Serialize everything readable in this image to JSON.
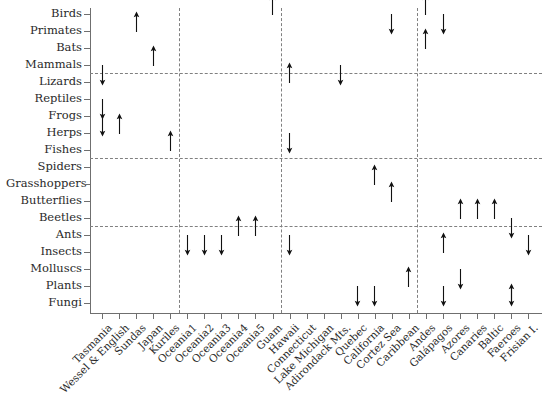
{
  "chart_data": {
    "type": "scatter",
    "title": "",
    "xlabel": "",
    "ylabel": "",
    "grid": false,
    "legend": null,
    "marker_semantics": {
      "up": "increase / positive effect",
      "down": "decrease / negative effect"
    },
    "categories_y": [
      "Birds",
      "Primates",
      "Bats",
      "Mammals",
      "Lizards",
      "Reptiles",
      "Frogs",
      "Herps",
      "Fishes",
      "Spiders",
      "Grasshoppers",
      "Butterflies",
      "Beetles",
      "Ants",
      "Insects",
      "Molluscs",
      "Plants",
      "Fungi"
    ],
    "categories_x": [
      "Tasmania",
      "Wessel & English",
      "Sundas",
      "Japan",
      "Kuriles",
      "Oceania1",
      "Oceania2",
      "Oceania3",
      "Oceania4",
      "Oceania5",
      "Guam",
      "Hawaii",
      "Connecticut",
      "Lake Michigan",
      "Adirondack Mts.",
      "Quebec",
      "California",
      "Cortez Sea",
      "Caribbean",
      "Andes",
      "Galápagos",
      "Azores",
      "Canaries",
      "Baltic",
      "Faeroes",
      "Frisian I."
    ],
    "group_separators_x": [
      "Kuriles",
      "Guam",
      "Caribbean"
    ],
    "reference_rows_y": [
      "Mammals",
      "Fishes",
      "Beetles"
    ],
    "points": [
      {
        "x": "Tasmania",
        "y": "Mammals",
        "dir": "down"
      },
      {
        "x": "Tasmania",
        "y": "Reptiles",
        "dir": "down"
      },
      {
        "x": "Tasmania",
        "y": "Frogs",
        "dir": "down"
      },
      {
        "x": "Wessel & English",
        "y": "Herps",
        "dir": "up"
      },
      {
        "x": "Sundas",
        "y": "Primates",
        "dir": "up"
      },
      {
        "x": "Japan",
        "y": "Mammals",
        "dir": "up"
      },
      {
        "x": "Kuriles",
        "y": "Fishes",
        "dir": "up"
      },
      {
        "x": "Oceania1",
        "y": "Ants",
        "dir": "down"
      },
      {
        "x": "Oceania2",
        "y": "Ants",
        "dir": "down"
      },
      {
        "x": "Oceania3",
        "y": "Ants",
        "dir": "down"
      },
      {
        "x": "Oceania4",
        "y": "Ants",
        "dir": "up"
      },
      {
        "x": "Oceania5",
        "y": "Ants",
        "dir": "up"
      },
      {
        "x": "Guam",
        "y": "Birds",
        "dir": "up"
      },
      {
        "x": "Hawaii",
        "y": "Lizards",
        "dir": "up"
      },
      {
        "x": "Hawaii",
        "y": "Herps",
        "dir": "down"
      },
      {
        "x": "Hawaii",
        "y": "Ants",
        "dir": "down"
      },
      {
        "x": "Adirondack Mts.",
        "y": "Mammals",
        "dir": "down"
      },
      {
        "x": "Quebec",
        "y": "Plants",
        "dir": "down"
      },
      {
        "x": "California",
        "y": "Grasshoppers",
        "dir": "up"
      },
      {
        "x": "California",
        "y": "Plants",
        "dir": "down"
      },
      {
        "x": "Cortez Sea",
        "y": "Birds",
        "dir": "down"
      },
      {
        "x": "Cortez Sea",
        "y": "Butterflies",
        "dir": "up"
      },
      {
        "x": "Caribbean",
        "y": "Plants",
        "dir": "up"
      },
      {
        "x": "Andes",
        "y": "Bats",
        "dir": "up"
      },
      {
        "x": "Andes",
        "y": "Birds",
        "dir": "up"
      },
      {
        "x": "Galápagos",
        "y": "Birds",
        "dir": "down"
      },
      {
        "x": "Galápagos",
        "y": "Insects",
        "dir": "up"
      },
      {
        "x": "Galápagos",
        "y": "Plants",
        "dir": "down"
      },
      {
        "x": "Azores",
        "y": "Beetles",
        "dir": "up"
      },
      {
        "x": "Azores",
        "y": "Molluscs",
        "dir": "down"
      },
      {
        "x": "Canaries",
        "y": "Beetles",
        "dir": "up"
      },
      {
        "x": "Baltic",
        "y": "Beetles",
        "dir": "up"
      },
      {
        "x": "Faeroes",
        "y": "Beetles",
        "dir": "down"
      },
      {
        "x": "Faeroes",
        "y": "Plants",
        "dir": "down"
      },
      {
        "x": "Faeroes",
        "y": "Fungi",
        "dir": "up"
      },
      {
        "x": "Frisian I.",
        "y": "Ants",
        "dir": "down"
      }
    ]
  },
  "colors": {
    "axis": "#6f6f6f",
    "guide": "#808080",
    "marker": "#111111",
    "text": "#2a2a2a",
    "background": "#ffffff"
  }
}
